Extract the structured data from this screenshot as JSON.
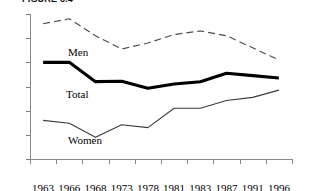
{
  "chart_data": {
    "type": "line",
    "title": "FIGURE 3.4",
    "xlabel": "",
    "ylabel": "",
    "ylim": [
      2,
      8
    ],
    "yticks": [
      2,
      3,
      4,
      5,
      6,
      7,
      8
    ],
    "grid": false,
    "legend": "inline-labels",
    "categories": [
      "1963",
      "1966",
      "1968",
      "1973",
      "1978",
      "1981",
      "1983",
      "1987",
      "1991",
      "1996"
    ],
    "series": [
      {
        "name": "Men",
        "style": "dashed",
        "values": [
          7.6,
          7.8,
          7.1,
          6.55,
          6.8,
          7.15,
          7.3,
          7.1,
          6.6,
          6.1
        ]
      },
      {
        "name": "Total",
        "style": "bold-solid",
        "values": [
          6.0,
          6.0,
          5.2,
          5.22,
          4.93,
          5.1,
          5.2,
          5.55,
          5.45,
          5.35
        ]
      },
      {
        "name": "Women",
        "style": "thin-solid",
        "values": [
          3.6,
          3.48,
          2.9,
          3.42,
          3.3,
          4.1,
          4.1,
          4.42,
          4.55,
          4.85
        ]
      }
    ]
  },
  "axis": {
    "y_labels": [
      "8",
      "7",
      "6",
      "5",
      "4",
      "3",
      "2"
    ],
    "x_labels": [
      "1963",
      "1966",
      "1968",
      "1973",
      "1978",
      "1981",
      "1983",
      "1987",
      "1991",
      "1996"
    ]
  },
  "labels": {
    "men": "Men",
    "total": "Total",
    "women": "Women"
  },
  "colors": {
    "men_line": "#4a4a4a",
    "total_line": "#000000",
    "women_line": "#3a3a3a",
    "axis": "#8a8a8a",
    "text": "#000000"
  }
}
